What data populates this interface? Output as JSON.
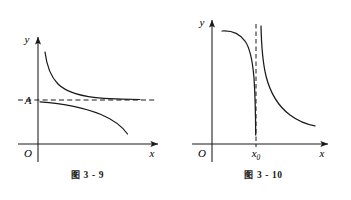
{
  "page": {
    "background": "#ffffff",
    "ink": "#1a1a1a",
    "width": 351,
    "height": 200
  },
  "figures": [
    {
      "id": "fig-3-9",
      "caption": "图 3 - 9",
      "caption_prefix": "图",
      "caption_number": "3 - 9",
      "axes": {
        "y_label": "y",
        "x_label": "x",
        "origin_label": "O",
        "x_axis_y": 144,
        "y_axis_x": 38
      },
      "markers": [
        {
          "name": "horizontal-asymptote-label",
          "label": "A",
          "y": 100
        }
      ],
      "asymptote": {
        "type": "horizontal",
        "label": "A",
        "style": "dashed",
        "y": 100,
        "x_from": 18,
        "x_to": 155
      },
      "curves": [
        {
          "name": "upper-branch",
          "description": "decreasing convex branch approaching y = A from above",
          "approaches": "A"
        },
        {
          "name": "lower-branch",
          "description": "branch starting near y = A dropping steeply downward",
          "approaches": "A"
        }
      ]
    },
    {
      "id": "fig-3-10",
      "caption": "图 3 - 10",
      "caption_prefix": "图",
      "caption_number": "3 - 10",
      "axes": {
        "y_label": "y",
        "x_label": "x",
        "origin_label": "O",
        "x_axis_y": 144,
        "y_axis_x": 36
      },
      "markers": [
        {
          "name": "vertical-asymptote-tick",
          "label_base": "x",
          "label_sub": "0",
          "x": 80
        }
      ],
      "asymptote": {
        "type": "vertical",
        "label_base": "x",
        "label_sub": "0",
        "style": "dashed",
        "x": 80,
        "y_from": 22,
        "y_to": 144
      },
      "curves": [
        {
          "name": "left-branch",
          "description": "decreasing branch falling to negative infinity at x0 from the left",
          "approaches": "x0"
        },
        {
          "name": "right-branch",
          "description": "branch descending from positive infinity at x0 flattening to the right",
          "approaches": "x0"
        }
      ]
    }
  ]
}
